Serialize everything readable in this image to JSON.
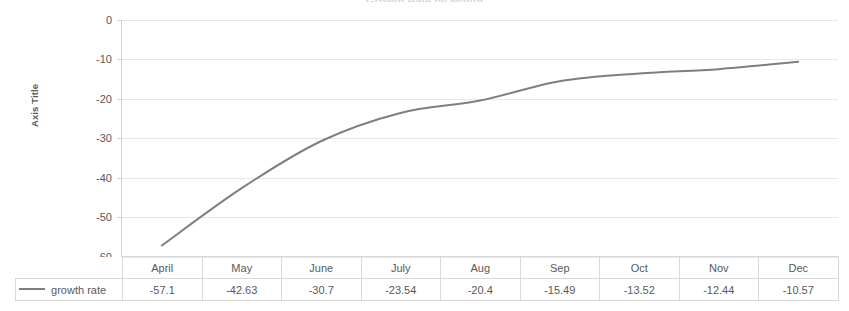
{
  "chart_data": {
    "type": "line",
    "title": "Growth Rate by Month",
    "xlabel": "",
    "ylabel": "Axis Title",
    "categories": [
      "April",
      "May",
      "June",
      "July",
      "Aug",
      "Sep",
      "Oct",
      "Nov",
      "Dec"
    ],
    "series": [
      {
        "name": "growth rate",
        "values": [
          -57.1,
          -42.63,
          -30.7,
          -23.54,
          -20.4,
          -15.49,
          -13.52,
          -12.44,
          -10.57
        ],
        "color": "#7f7f7f",
        "smooth": true
      }
    ],
    "ylim": [
      -60,
      0
    ],
    "yticks": [
      0,
      -10,
      -20,
      -30,
      -40,
      -50,
      -60
    ],
    "ytick_labels": [
      "0",
      "-10",
      "-20",
      "-30",
      "-40",
      "-50",
      "-60"
    ],
    "grid": true,
    "grid_color": "#e8e8e8",
    "legend": "data-table",
    "has_data_table": true
  },
  "axis": {
    "y_title": "Axis Title",
    "tick_labels": [
      "0",
      "-10",
      "-20",
      "-30",
      "-40",
      "-50",
      "-60"
    ]
  },
  "table": {
    "legend_series_label": "growth rate",
    "headers": [
      "April",
      "May",
      "June",
      "July",
      "Aug",
      "Sep",
      "Oct",
      "Nov",
      "Dec"
    ],
    "values": [
      "-57.1",
      "-42.63",
      "-30.7",
      "-23.54",
      "-20.4",
      "-15.49",
      "-13.52",
      "-12.44",
      "-10.57"
    ]
  },
  "colors": {
    "series_line": "#7f7f7f",
    "gridline": "#e8e8e8",
    "table_border": "#d9d9d9",
    "text": "#595959"
  }
}
